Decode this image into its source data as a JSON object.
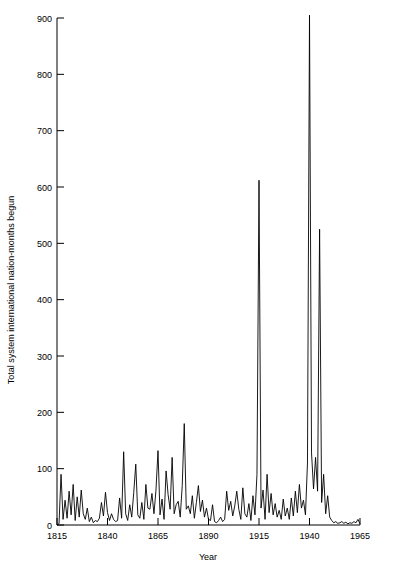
{
  "chart_data": {
    "type": "line",
    "title": "",
    "xlabel": "Year",
    "ylabel": "Total system international nation-months begun",
    "xlim": [
      1815,
      1965
    ],
    "ylim": [
      0,
      900
    ],
    "xticks": [
      1815,
      1840,
      1865,
      1890,
      1915,
      1940,
      1965
    ],
    "xtick_labels": [
      "1815",
      "1840",
      "1865",
      "1890",
      "1915",
      "1940",
      "1965"
    ],
    "yticks": [
      0,
      100,
      200,
      300,
      400,
      500,
      600,
      700,
      800,
      900
    ],
    "ytick_labels": [
      "0",
      "100",
      "200",
      "300",
      "400",
      "500",
      "600",
      "700",
      "800",
      "900"
    ],
    "grid": false,
    "legend": false,
    "line_color": "#000000",
    "background_color": "#ffffff",
    "x": [
      1815,
      1816,
      1817,
      1818,
      1819,
      1820,
      1821,
      1822,
      1823,
      1824,
      1825,
      1826,
      1827,
      1828,
      1829,
      1830,
      1831,
      1832,
      1833,
      1834,
      1835,
      1836,
      1837,
      1838,
      1839,
      1840,
      1841,
      1842,
      1843,
      1844,
      1845,
      1846,
      1847,
      1848,
      1849,
      1850,
      1851,
      1852,
      1853,
      1854,
      1855,
      1856,
      1857,
      1858,
      1859,
      1860,
      1861,
      1862,
      1863,
      1864,
      1865,
      1866,
      1867,
      1868,
      1869,
      1870,
      1871,
      1872,
      1873,
      1874,
      1875,
      1876,
      1877,
      1878,
      1879,
      1880,
      1881,
      1882,
      1883,
      1884,
      1885,
      1886,
      1887,
      1888,
      1889,
      1890,
      1891,
      1892,
      1893,
      1894,
      1895,
      1896,
      1897,
      1898,
      1899,
      1900,
      1901,
      1902,
      1903,
      1904,
      1905,
      1906,
      1907,
      1908,
      1909,
      1910,
      1911,
      1912,
      1913,
      1914,
      1915,
      1916,
      1917,
      1918,
      1919,
      1920,
      1921,
      1922,
      1923,
      1924,
      1925,
      1926,
      1927,
      1928,
      1929,
      1930,
      1931,
      1932,
      1933,
      1934,
      1935,
      1936,
      1937,
      1938,
      1939,
      1940,
      1941,
      1942,
      1943,
      1944,
      1945,
      1946,
      1947,
      1948,
      1949,
      1950,
      1951,
      1952,
      1953,
      1954,
      1955,
      1956,
      1957,
      1958,
      1959,
      1960,
      1961,
      1962,
      1963,
      1964,
      1965
    ],
    "values": [
      0,
      2,
      90,
      10,
      44,
      12,
      60,
      18,
      72,
      8,
      50,
      14,
      62,
      20,
      10,
      30,
      6,
      14,
      4,
      8,
      6,
      12,
      40,
      16,
      58,
      22,
      8,
      20,
      10,
      6,
      8,
      48,
      12,
      130,
      20,
      8,
      36,
      14,
      58,
      108,
      18,
      12,
      40,
      10,
      72,
      30,
      28,
      56,
      20,
      62,
      132,
      18,
      46,
      10,
      96,
      54,
      28,
      120,
      20,
      36,
      42,
      14,
      70,
      180,
      28,
      34,
      20,
      52,
      12,
      40,
      70,
      24,
      44,
      14,
      30,
      10,
      8,
      36,
      6,
      4,
      8,
      14,
      6,
      10,
      60,
      26,
      42,
      16,
      34,
      60,
      28,
      10,
      66,
      20,
      14,
      38,
      8,
      52,
      18,
      90,
      612,
      30,
      62,
      10,
      90,
      22,
      56,
      18,
      38,
      14,
      26,
      10,
      46,
      16,
      30,
      10,
      48,
      16,
      60,
      22,
      72,
      30,
      44,
      18,
      110,
      905,
      128,
      64,
      120,
      60,
      525,
      40,
      90,
      20,
      52,
      14,
      8,
      4,
      6,
      3,
      4,
      6,
      3,
      5,
      2,
      4,
      3,
      6,
      4,
      10,
      2
    ]
  }
}
